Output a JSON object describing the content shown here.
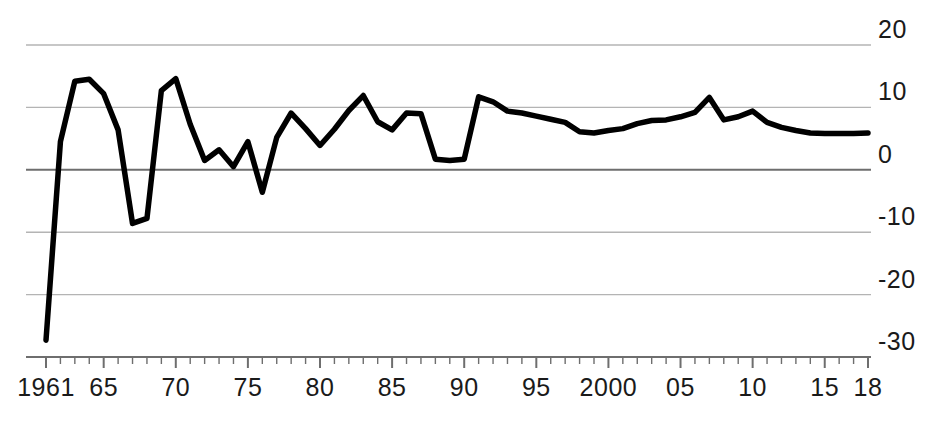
{
  "chart_data": {
    "type": "line",
    "title": "",
    "subtitle": "",
    "xlabel": "",
    "ylabel": "",
    "xlim": [
      1961,
      2018
    ],
    "ylim": [
      -30,
      20
    ],
    "grid": true,
    "legend": false,
    "legend_position": "none",
    "line_color": "#000000",
    "grid_color": "#b4b4b4",
    "zero_line_color": "#6e6e6e",
    "axis_color": "#6e6e6e",
    "background_color": "#ffffff",
    "y_ticks": [
      20,
      10,
      0,
      -10,
      -20,
      -30
    ],
    "y_tick_labels": [
      "20",
      "10",
      "0",
      "-10",
      "-20",
      "-30"
    ],
    "x_ticks": [
      1961,
      1965,
      1970,
      1975,
      1980,
      1985,
      1990,
      1995,
      2000,
      2005,
      2010,
      2015,
      2018
    ],
    "x_tick_labels": [
      "1961",
      "65",
      "70",
      "75",
      "80",
      "85",
      "90",
      "95",
      "2000",
      "05",
      "10",
      "15",
      "18"
    ],
    "x_minor_tick_step": 1,
    "x": [
      1961,
      1962,
      1963,
      1964,
      1965,
      1966,
      1967,
      1968,
      1969,
      1970,
      1971,
      1972,
      1973,
      1974,
      1975,
      1976,
      1977,
      1978,
      1979,
      1980,
      1981,
      1982,
      1983,
      1984,
      1985,
      1986,
      1987,
      1988,
      1989,
      1990,
      1991,
      1992,
      1993,
      1994,
      1995,
      1996,
      1997,
      1998,
      1999,
      2000,
      2001,
      2002,
      2003,
      2004,
      2005,
      2006,
      2007,
      2008,
      2009,
      2010,
      2011,
      2012,
      2013,
      2014,
      2015,
      2016,
      2017,
      2018
    ],
    "values": [
      -27.3,
      4.5,
      14.2,
      14.5,
      12.2,
      6.4,
      -8.6,
      -7.8,
      12.7,
      14.6,
      7.3,
      1.5,
      3.2,
      0.5,
      4.5,
      -3.6,
      5.2,
      9.1,
      6.6,
      3.9,
      6.5,
      9.5,
      11.9,
      7.7,
      6.4,
      9.1,
      9.0,
      1.7,
      1.5,
      1.7,
      11.7,
      10.9,
      9.4,
      9.1,
      8.6,
      8.1,
      7.6,
      6.1,
      5.9,
      6.3,
      6.6,
      7.4,
      7.9,
      8.0,
      8.5,
      9.2,
      11.6,
      8.0,
      8.5,
      9.4,
      7.6,
      6.8,
      6.3,
      5.9,
      5.8,
      5.8,
      5.8,
      5.9
    ],
    "series": [
      {
        "name": "series-1",
        "values": [
          -27.3,
          4.5,
          14.2,
          14.5,
          12.2,
          6.4,
          -8.6,
          -7.8,
          12.7,
          14.6,
          7.3,
          1.5,
          3.2,
          0.5,
          4.5,
          -3.6,
          5.2,
          9.1,
          6.6,
          3.9,
          6.5,
          9.5,
          11.9,
          7.7,
          6.4,
          9.1,
          9.0,
          1.7,
          1.5,
          1.7,
          11.7,
          10.9,
          9.4,
          9.1,
          8.6,
          8.1,
          7.6,
          6.1,
          5.9,
          6.3,
          6.6,
          7.4,
          7.9,
          8.0,
          8.5,
          9.2,
          11.6,
          8.0,
          8.5,
          9.4,
          7.6,
          6.8,
          6.3,
          5.9,
          5.8,
          5.8,
          5.8,
          5.9
        ]
      }
    ],
    "annotations": []
  }
}
